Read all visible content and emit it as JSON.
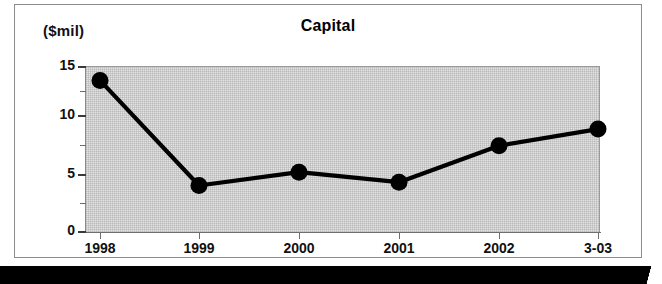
{
  "chart_data": {
    "type": "line",
    "title": "Capital",
    "ylabel": "($mil)",
    "xlabel": "",
    "categories": [
      "1998",
      "1999",
      "2000",
      "2001",
      "2002",
      "3-03"
    ],
    "values": [
      13.7,
      4.2,
      5.4,
      4.5,
      7.8,
      9.3
    ],
    "series": [
      {
        "name": "Capital",
        "values": [
          13.7,
          4.2,
          5.4,
          4.5,
          7.8,
          9.3
        ]
      }
    ],
    "ylim": [
      0,
      15
    ],
    "y_major_ticks": [
      "0",
      "5",
      "10",
      "15"
    ],
    "y_minor_tick_values": [
      2.5,
      7.5,
      12.5
    ],
    "grid": true,
    "legend": "none",
    "marker": "filled-circle",
    "line_color": "#000000",
    "plot_background": "#e3e3e3"
  },
  "figure": {
    "title": "Capital",
    "y_axis_caption": "($mil)",
    "y_axis_labels": [
      "15",
      "10",
      "5",
      "0"
    ],
    "x_axis_labels": [
      "1998",
      "1999",
      "2000",
      "2001",
      "2002",
      "3-03"
    ]
  }
}
